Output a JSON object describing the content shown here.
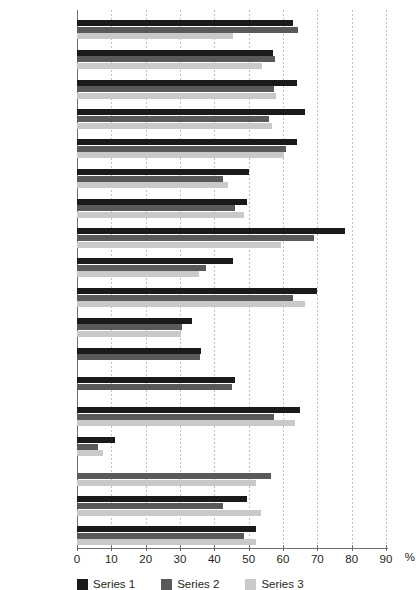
{
  "chart_data": {
    "type": "bar",
    "orientation": "horizontal",
    "title": "",
    "xlabel": "%",
    "ylabel": "",
    "xlim": [
      0,
      90
    ],
    "xticks": [
      0,
      10,
      20,
      30,
      40,
      50,
      60,
      70,
      80,
      90
    ],
    "xtick_labels": [
      "0",
      "10",
      "20",
      "30",
      "40",
      "50",
      "60",
      "70",
      "80",
      "90"
    ],
    "grid": true,
    "grid_axis": "x",
    "legend_position": "bottom",
    "categories": [
      "Egypt",
      "Jordan",
      "Lebanon",
      "Palestine",
      "Saudi Arabia",
      "Syria",
      "Iraq",
      "Turkey",
      "Iran",
      "UAE",
      "USA",
      "UK",
      "France",
      "China",
      "Israel",
      "Qatar",
      "Russia",
      "Germany"
    ],
    "series": [
      {
        "name": "Series 1",
        "color": "#1a1a1a",
        "values": [
          63,
          57,
          64,
          66.5,
          64,
          50,
          49.5,
          78,
          45.5,
          70,
          33.5,
          36,
          46,
          65,
          11,
          0,
          49.5,
          52
        ]
      },
      {
        "name": "Series 2",
        "color": "#58595b",
        "values": [
          64.3,
          57.6,
          57.3,
          56,
          60.8,
          42.6,
          46,
          69,
          37.7,
          62.8,
          30.5,
          35.7,
          45,
          57.3,
          6,
          56.4,
          42.4,
          48.7
        ]
      },
      {
        "name": "Series 3",
        "color": "#c8c9cb",
        "values": [
          45.5,
          53.9,
          57.9,
          56.8,
          60.2,
          44,
          48.7,
          59.3,
          35.4,
          66.5,
          30.2,
          0,
          0,
          63.4,
          7.5,
          52,
          53.6,
          52
        ]
      }
    ]
  },
  "axis": {
    "unit_label": "%"
  },
  "legend": {
    "items": [
      {
        "label": "Series 1",
        "color": "#1a1a1a"
      },
      {
        "label": "Series 2",
        "color": "#58595b"
      },
      {
        "label": "Series 3",
        "color": "#c8c9cb"
      }
    ]
  }
}
